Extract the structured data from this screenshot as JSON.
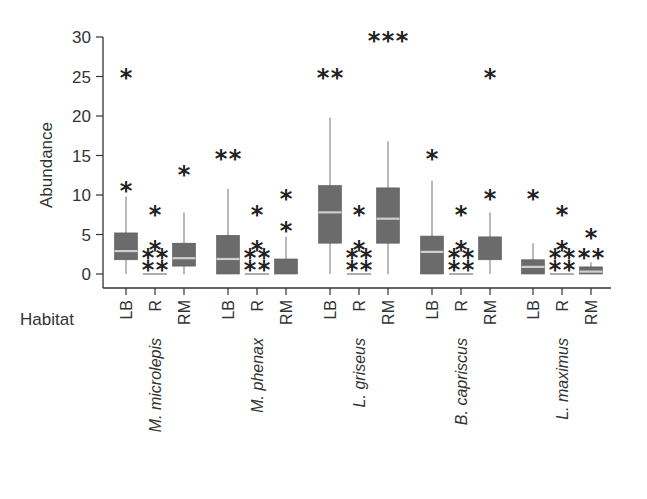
{
  "chart_data": {
    "type": "boxplot",
    "title": "",
    "ylabel": "Abundance",
    "xlabel": "Habitat",
    "ylim": [
      0,
      30
    ],
    "yticks": [
      0,
      5,
      10,
      15,
      20,
      25,
      30
    ],
    "grid": false,
    "legend": null,
    "colors": {
      "box_fill": "#6b6b6b",
      "median": "#cfcfcf",
      "whisker": "#8a8a8a",
      "axis": "#333333",
      "outlier": "#222222"
    },
    "habitats": [
      "LB",
      "R",
      "RM"
    ],
    "species": [
      "M. microlepis",
      "M. phenax",
      "L. griseus",
      "B. capriscus",
      "L. maximus"
    ],
    "groups": [
      {
        "species": "M. microlepis",
        "boxes": [
          {
            "habitat": "LB",
            "min": 0,
            "q1": 1.8,
            "median": 2.9,
            "q3": 5.2,
            "max": 9.8,
            "outliers": [
              10.5,
              24.8
            ]
          },
          {
            "habitat": "R",
            "min": 0,
            "q1": 0,
            "median": 0,
            "q3": 0,
            "max": 0,
            "outliers": [
              0.5,
              0.5,
              2.0,
              2.0,
              3.0,
              7.5
            ]
          },
          {
            "habitat": "RM",
            "min": 0,
            "q1": 1.0,
            "median": 2.0,
            "q3": 3.9,
            "max": 7.8,
            "outliers": [
              12.5
            ]
          }
        ]
      },
      {
        "species": "M. phenax",
        "boxes": [
          {
            "habitat": "LB",
            "min": 0,
            "q1": 0,
            "median": 1.9,
            "q3": 4.9,
            "max": 10.8,
            "outliers": [
              14.5,
              14.5
            ]
          },
          {
            "habitat": "R",
            "min": 0,
            "q1": 0,
            "median": 0,
            "q3": 0,
            "max": 0,
            "outliers": [
              0.5,
              0.5,
              2.0,
              2.0,
              3.0,
              7.5
            ]
          },
          {
            "habitat": "RM",
            "min": 0,
            "q1": 0,
            "median": 0,
            "q3": 1.9,
            "max": 4.7,
            "outliers": [
              5.5,
              9.5
            ]
          }
        ]
      },
      {
        "species": "L. griseus",
        "boxes": [
          {
            "habitat": "LB",
            "min": 0,
            "q1": 3.9,
            "median": 7.8,
            "q3": 11.2,
            "max": 19.8,
            "outliers": [
              24.8,
              24.8
            ]
          },
          {
            "habitat": "R",
            "min": 0,
            "q1": 0,
            "median": 0,
            "q3": 0,
            "max": 0,
            "outliers": [
              0.5,
              0.5,
              2.0,
              2.0,
              3.0,
              7.5
            ]
          },
          {
            "habitat": "RM",
            "min": 0,
            "q1": 3.9,
            "median": 7.0,
            "q3": 10.9,
            "max": 16.8,
            "outliers": [
              29.5,
              29.5,
              29.5
            ]
          }
        ]
      },
      {
        "species": "B. capriscus",
        "boxes": [
          {
            "habitat": "LB",
            "min": 0,
            "q1": 0,
            "median": 2.8,
            "q3": 4.8,
            "max": 11.8,
            "outliers": [
              14.5
            ]
          },
          {
            "habitat": "R",
            "min": 0,
            "q1": 0,
            "median": 0,
            "q3": 0,
            "max": 0,
            "outliers": [
              0.5,
              0.5,
              2.0,
              2.0,
              3.0,
              7.5
            ]
          },
          {
            "habitat": "RM",
            "min": 0,
            "q1": 1.8,
            "median": 1.8,
            "q3": 4.7,
            "max": 7.8,
            "outliers": [
              9.5,
              24.8
            ]
          }
        ]
      },
      {
        "species": "L. maximus",
        "boxes": [
          {
            "habitat": "LB",
            "min": 0,
            "q1": 0,
            "median": 0.9,
            "q3": 1.8,
            "max": 3.9,
            "outliers": [
              9.5
            ]
          },
          {
            "habitat": "R",
            "min": 0,
            "q1": 0,
            "median": 0,
            "q3": 0,
            "max": 0,
            "outliers": [
              0.5,
              0.5,
              2.0,
              2.0,
              3.0,
              7.5
            ]
          },
          {
            "habitat": "RM",
            "min": 0,
            "q1": 0,
            "median": 0.3,
            "q3": 0.9,
            "max": 1.5,
            "outliers": [
              2.0,
              2.0,
              4.5
            ]
          }
        ]
      }
    ]
  },
  "labels": {
    "ylabel": "Abundance",
    "habitat_row_label": "Habitat"
  }
}
